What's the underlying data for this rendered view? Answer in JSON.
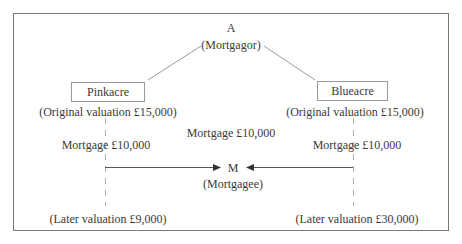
{
  "diagram": {
    "mortgagor": {
      "name": "A",
      "role": "(Mortgagor)"
    },
    "mortgagee": {
      "name": "M",
      "role": "(Mortgagee)"
    },
    "central_label": "Mortgage £10,000",
    "properties": [
      {
        "name": "Pinkacre",
        "original_valuation": "(Original valuation £15,000)",
        "mortgage": "Mortgage £10,000",
        "later_valuation": "(Later valuation £9,000)"
      },
      {
        "name": "Blueacre",
        "original_valuation": "(Original valuation £15,000)",
        "mortgage": "Mortgage £10,000",
        "later_valuation": "(Later valuation £30,000)"
      }
    ],
    "colors": {
      "frame": "#7a7a7a",
      "box_border": "#9a9a9a",
      "line": "#9a9a9a",
      "arrow": "#333333",
      "text": "#3a3a3a"
    }
  }
}
